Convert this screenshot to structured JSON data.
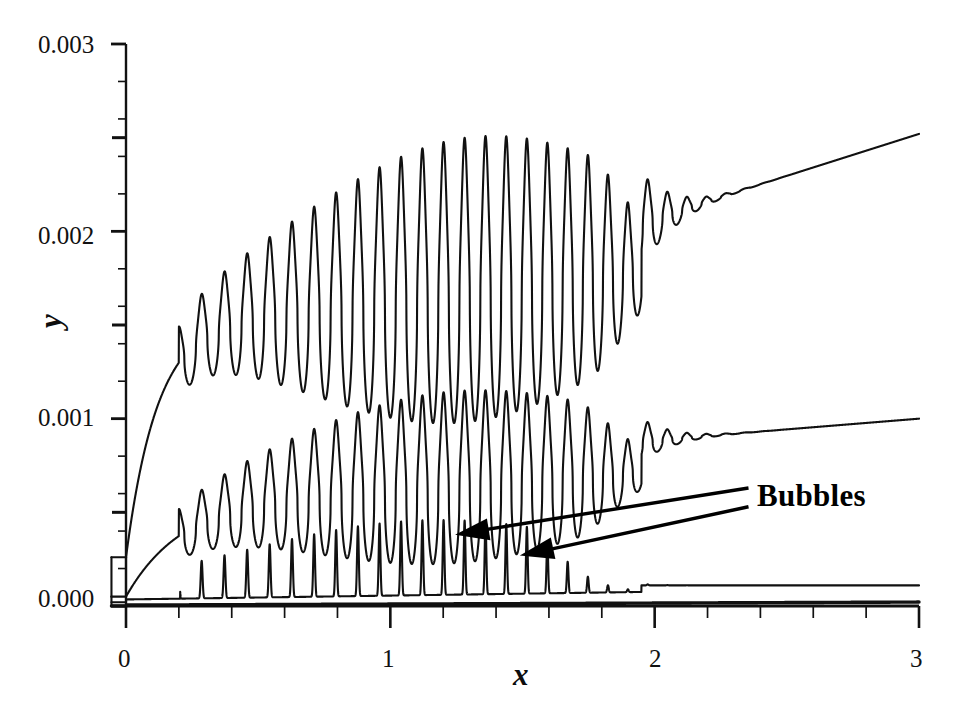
{
  "chart_data": {
    "type": "line",
    "title": "",
    "subtitle": "",
    "xlabel": "x",
    "ylabel": "y",
    "xlim": [
      -0.06,
      3.0
    ],
    "ylim": [
      0.0,
      0.003
    ],
    "grid": false,
    "legend_position": "none",
    "x_ticks": [
      "0",
      "1",
      "2",
      "3"
    ],
    "x_tick_values": [
      0,
      1,
      2,
      3
    ],
    "x_minor_tick_step": 0.2,
    "y_ticks": [
      "0.000",
      "0.001",
      "0.002",
      "0.003"
    ],
    "y_tick_values": [
      0.0,
      0.001,
      0.002,
      0.003
    ],
    "y_minor_tick_step": 0.0002,
    "annotations": [
      {
        "text": "Bubbles",
        "x": 2.39,
        "y": 0.000495,
        "arrows": [
          {
            "tail_x": 2.355,
            "tail_y": 0.00063,
            "tip_x": 1.245,
            "tip_y": 0.00038
          },
          {
            "tail_x": 2.355,
            "tail_y": 0.00053,
            "tip_x": 1.49,
            "tip_y": 0.00027
          }
        ]
      }
    ],
    "series": [
      {
        "name": "upper-curve",
        "description": "Upper oscillating curve: rises from ~0.00025 at x=0, damped high-amplitude oscillations peaking near 0.00258 around x=1.37, decaying to a smooth rising tail reaching 0.00252 at x=3",
        "baseline_start": 0.00026,
        "tail_end": 0.00252,
        "peak_max": 0.00258,
        "peak_max_x": 1.37
      },
      {
        "name": "middle-curve",
        "description": "Middle oscillating curve: rises from ~0.00005 at x=0, damped oscillations peaking near 0.00133 around x=1.3, decaying to a nearly flat tail at 0.00100 at x=3",
        "baseline_start": 5e-05,
        "tail_end": 0.001,
        "peak_max": 0.00133,
        "peak_max_x": 1.3
      },
      {
        "name": "lower-spike-curve",
        "description": "Lower curve of narrow sharp spikes on a near-zero baseline; spike amplitudes peak near 0.00040 around x=1.2 then fade to a flat step tail at 0.00011 beyond x=2",
        "baseline_start": 2e-05,
        "tail_end": 0.00011,
        "peak_max": 0.00041,
        "peak_max_x": 1.21
      },
      {
        "name": "axis-baseline-curve",
        "description": "Heavy near-zero trace that hugs the x-axis across the whole domain",
        "baseline_start": 0.0,
        "tail_end": 2e-05
      }
    ]
  },
  "axes": {
    "y_label": "y",
    "x_label": "x",
    "y_tick_labels": [
      "0.000",
      "0.001",
      "0.002",
      "0.003"
    ],
    "x_tick_labels": [
      "0",
      "1",
      "2",
      "3"
    ]
  },
  "annotation": {
    "bubbles_label": "Bubbles"
  },
  "colors": {
    "line": "#111111",
    "axis": "#111111",
    "background": "#ffffff",
    "text": "#111111"
  }
}
